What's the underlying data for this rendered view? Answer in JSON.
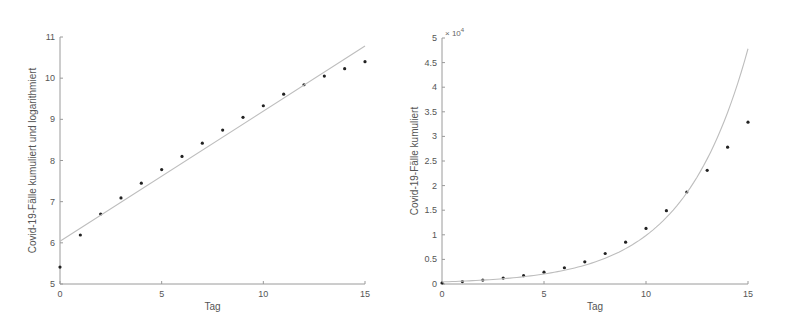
{
  "chart_data": [
    {
      "type": "scatter",
      "title": "",
      "xlabel": "Tag",
      "ylabel": "Covid-19-Fälle kumuliert und logarithmiert",
      "xlim": [
        0,
        15
      ],
      "ylim": [
        5,
        11
      ],
      "xticks": [
        0,
        5,
        10,
        15
      ],
      "yticks": [
        5,
        6,
        7,
        8,
        9,
        10,
        11
      ],
      "grid": false,
      "legend": null,
      "series": [
        {
          "name": "data",
          "kind": "scatter",
          "x": [
            0,
            1,
            2,
            3,
            4,
            5,
            6,
            7,
            8,
            9,
            10,
            11,
            12,
            13,
            14,
            15
          ],
          "y": [
            5.41,
            6.19,
            6.7,
            7.09,
            7.45,
            7.78,
            8.1,
            8.42,
            8.74,
            9.05,
            9.33,
            9.61,
            9.84,
            10.05,
            10.23,
            10.4
          ]
        },
        {
          "name": "linear fit",
          "kind": "line",
          "x": [
            0,
            15
          ],
          "y": [
            6.04,
            10.78
          ]
        }
      ]
    },
    {
      "type": "scatter",
      "title": "",
      "xlabel": "Tag",
      "ylabel": "Covid-19-Fälle kumuliert",
      "y_exponent_label": "× 10",
      "y_exponent": "4",
      "xlim": [
        0,
        15
      ],
      "ylim": [
        0,
        5
      ],
      "xticks": [
        0,
        5,
        10,
        15
      ],
      "yticks": [
        0,
        0.5,
        1,
        1.5,
        2,
        2.5,
        3,
        3.5,
        4,
        4.5,
        5
      ],
      "ytick_labels": [
        "0",
        "0.5",
        "1",
        "1.5",
        "2",
        "2.5",
        "3",
        "3.5",
        "4",
        "4.5",
        "5"
      ],
      "grid": false,
      "legend": null,
      "series": [
        {
          "name": "data (×10^4)",
          "kind": "scatter",
          "x": [
            0,
            1,
            2,
            3,
            4,
            5,
            6,
            7,
            8,
            9,
            10,
            11,
            12,
            13,
            14,
            15
          ],
          "y": [
            0.02,
            0.05,
            0.08,
            0.12,
            0.17,
            0.24,
            0.33,
            0.45,
            0.62,
            0.85,
            1.13,
            1.49,
            1.87,
            2.31,
            2.78,
            3.29
          ]
        },
        {
          "name": "exponential fit (×10^4)",
          "kind": "curve",
          "x": [
            0,
            1,
            2,
            3,
            4,
            5,
            6,
            7,
            8,
            9,
            10,
            11,
            12,
            13,
            14,
            15
          ],
          "y": [
            0.042,
            0.058,
            0.079,
            0.108,
            0.148,
            0.203,
            0.279,
            0.382,
            0.524,
            0.719,
            0.986,
            1.352,
            1.854,
            2.543,
            3.487,
            4.782
          ]
        }
      ]
    }
  ],
  "plots": [
    {
      "box": {
        "left": 60,
        "right": 365,
        "top": 37,
        "bottom": 284
      }
    },
    {
      "box": {
        "left": 442,
        "right": 748,
        "top": 38,
        "bottom": 284
      }
    }
  ]
}
